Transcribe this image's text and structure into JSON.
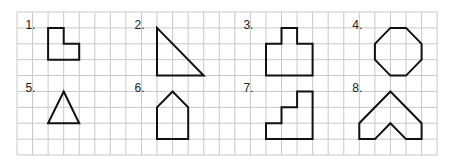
{
  "worksheet": {
    "grid": {
      "left": 17,
      "top": 12,
      "cols": 27,
      "rows": 9,
      "cell_w": 15.56,
      "cell_h": 15.89,
      "line_color": "#c8c8c8"
    },
    "stroke_color": "#111111",
    "figures": [
      {
        "label": "1.",
        "name": "l-shape",
        "label_pos": [
          0.55,
          1.05
        ],
        "points": [
          [
            2,
            1
          ],
          [
            3,
            1
          ],
          [
            3,
            2
          ],
          [
            4,
            2
          ],
          [
            4,
            3
          ],
          [
            2,
            3
          ]
        ]
      },
      {
        "label": "2.",
        "name": "right-triangle",
        "label_pos": [
          7.55,
          1.05
        ],
        "points": [
          [
            9,
            1
          ],
          [
            9,
            4
          ],
          [
            12,
            4
          ]
        ]
      },
      {
        "label": "3.",
        "name": "stepped-rectangle",
        "label_pos": [
          14.55,
          1.05
        ],
        "points": [
          [
            17,
            1
          ],
          [
            18,
            1
          ],
          [
            18,
            2
          ],
          [
            19,
            2
          ],
          [
            19,
            4
          ],
          [
            16,
            4
          ],
          [
            16,
            2
          ],
          [
            17,
            2
          ]
        ]
      },
      {
        "label": "4.",
        "name": "octagon",
        "label_pos": [
          21.55,
          1.05
        ],
        "points": [
          [
            24,
            1
          ],
          [
            25,
            1
          ],
          [
            26,
            2
          ],
          [
            26,
            3
          ],
          [
            25,
            4
          ],
          [
            24,
            4
          ],
          [
            23,
            3
          ],
          [
            23,
            2
          ]
        ]
      },
      {
        "label": "5.",
        "name": "triangle",
        "label_pos": [
          0.55,
          5.05
        ],
        "points": [
          [
            3,
            5
          ],
          [
            4,
            7
          ],
          [
            2,
            7
          ]
        ]
      },
      {
        "label": "6.",
        "name": "pentagon-house",
        "label_pos": [
          7.55,
          5.05
        ],
        "points": [
          [
            10,
            5
          ],
          [
            11,
            6
          ],
          [
            11,
            8
          ],
          [
            9,
            8
          ],
          [
            9,
            6
          ]
        ]
      },
      {
        "label": "7.",
        "name": "staircase",
        "label_pos": [
          14.55,
          5.05
        ],
        "points": [
          [
            18,
            5
          ],
          [
            19,
            5
          ],
          [
            19,
            8
          ],
          [
            16,
            8
          ],
          [
            16,
            7
          ],
          [
            17,
            7
          ],
          [
            17,
            6
          ],
          [
            18,
            6
          ]
        ]
      },
      {
        "label": "8.",
        "name": "chevron",
        "label_pos": [
          21.55,
          5.05
        ],
        "points": [
          [
            24,
            5
          ],
          [
            26,
            7
          ],
          [
            26,
            8
          ],
          [
            25,
            8
          ],
          [
            24,
            7
          ],
          [
            23,
            8
          ],
          [
            22,
            8
          ],
          [
            22,
            7
          ]
        ]
      }
    ]
  }
}
